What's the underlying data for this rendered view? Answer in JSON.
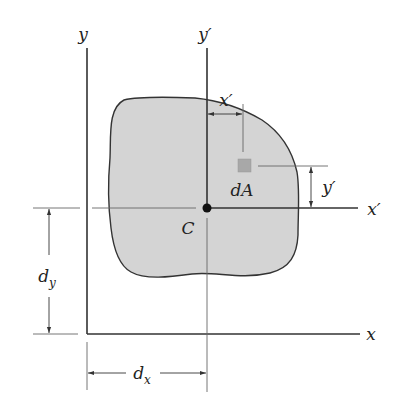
{
  "figure": {
    "labels": {
      "y_axis": "y",
      "y_prime_axis": "y′",
      "x_axis": "x",
      "x_prime_axis": "x′",
      "centroid": "C",
      "area_element": "dA",
      "x_prime_dim": "x′",
      "y_prime_dim": "y′",
      "dy_main": "d",
      "dy_sub": "y",
      "dx_main": "d",
      "dx_sub": "x"
    },
    "colors": {
      "shape_fill": "#d4d4d4",
      "shape_stroke": "#333333",
      "axis": "#333333",
      "dim_line": "#555555",
      "element_fill": "#a8a8a8",
      "centroid": "#111111"
    }
  }
}
